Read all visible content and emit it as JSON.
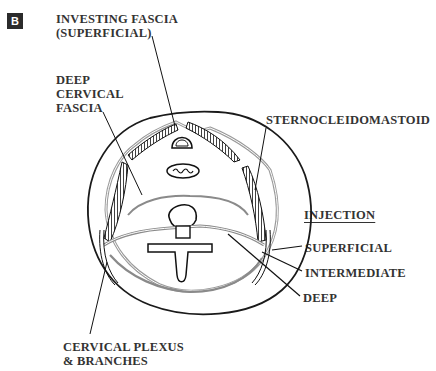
{
  "figure": {
    "panel_label": "B",
    "labels": {
      "investing_fascia_line1": "INVESTING FASCIA",
      "investing_fascia_line2": "(SUPERFICIAL)",
      "deep_cervical_line1": "DEEP",
      "deep_cervical_line2": "CERVICAL",
      "deep_cervical_line3": "FASCIA",
      "sternocleidomastoid": "STERNOCLEIDOMASTOID",
      "injection_heading": "INJECTION",
      "superficial": "SUPERFICIAL",
      "intermediate": "INTERMEDIATE",
      "deep": "DEEP",
      "cervical_plexus_line1": "CERVICAL PLEXUS",
      "cervical_plexus_line2": "& BRANCHES"
    },
    "colors": {
      "outline": "#1a1a1a",
      "fascia_gray": "#8a8a8a",
      "text": "#333333"
    }
  }
}
